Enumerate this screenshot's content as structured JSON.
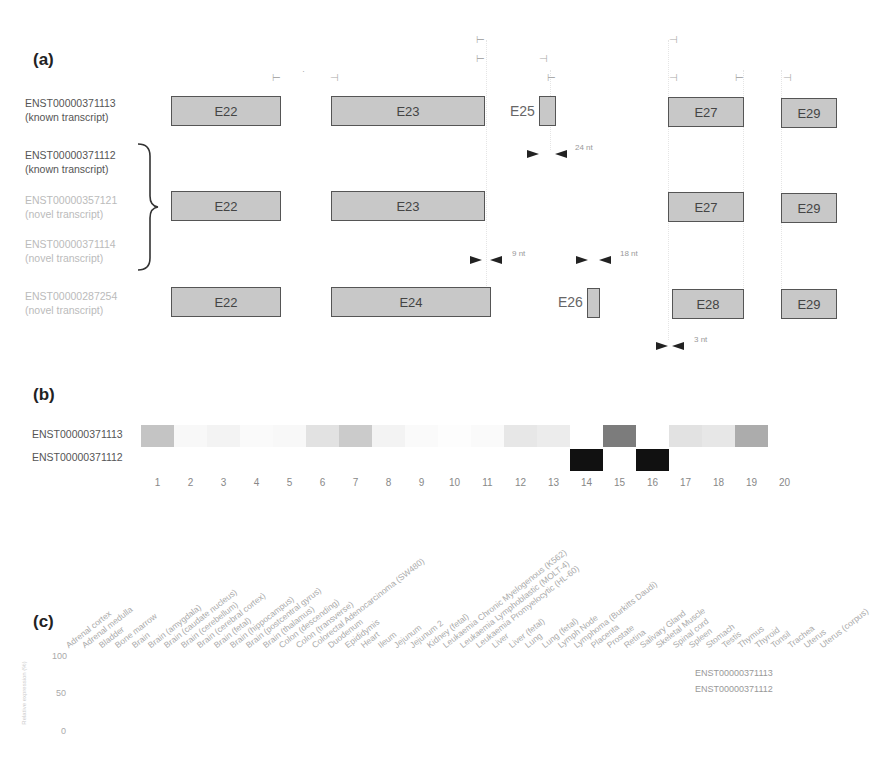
{
  "panel_a": {
    "label": "(a)",
    "transcripts": [
      {
        "id": "ENST00000371113",
        "note": "(known transcript)",
        "faint": false
      },
      {
        "id": "ENST00000371112",
        "note": "(known transcript)",
        "faint": false
      },
      {
        "id": "ENST00000357121",
        "note": "(novel transcript)",
        "faint": true
      },
      {
        "id": "ENST00000371114",
        "note": "(novel transcript)",
        "faint": true
      },
      {
        "id": "ENST00000287254",
        "note": "(novel transcript)",
        "faint": true
      }
    ],
    "row1_exons": [
      "E22",
      "E23",
      "E25",
      "E27",
      "E29"
    ],
    "row2_exons": [
      "E22",
      "E23",
      "E27",
      "E29"
    ],
    "row3_exons": [
      "E22",
      "E24",
      "E26",
      "E28",
      "E29"
    ],
    "arrow_labels": [
      "24 nt",
      "9 nt",
      "18 nt",
      "3 nt"
    ]
  },
  "panel_b": {
    "label": "(b)",
    "rows": [
      "ENST00000371113",
      "ENST00000371112"
    ],
    "columns": [
      "1",
      "2",
      "3",
      "4",
      "5",
      "6",
      "7",
      "8",
      "9",
      "10",
      "11",
      "12",
      "13",
      "14",
      "15",
      "16",
      "17",
      "18",
      "19",
      "20"
    ]
  },
  "panel_c": {
    "label": "(c)",
    "y_ticks": [
      "100",
      "50",
      "0"
    ],
    "y_axis_label": "Relative expression (%)",
    "tissues": [
      "Adrenal cortex",
      "Adrenal medulla",
      "Bladder",
      "Bone marrow",
      "Brain",
      "Brain (amygdala)",
      "Brain (caudate nucleus)",
      "Brain (cerebellum)",
      "Brain (cerebral cortex)",
      "Brain (fetal)",
      "Brain (hippocampus)",
      "Brain (postcentral gyrus)",
      "Brain (thalamus)",
      "Colon (descending)",
      "Colon (transverse)",
      "Colorectal Adenocarcinoma (SW480)",
      "Duodenum",
      "Epididymis",
      "Heart",
      "Ileum",
      "Jejunum",
      "Jejunum 2",
      "Kidney (fetal)",
      "Leukaemia Chronic Myelogenous (K562)",
      "Leukaemia Lymphoblastic (MOLT-4)",
      "Leukaemia Promyelocytic (HL-60)",
      "Liver",
      "Liver (fetal)",
      "Lung",
      "Lung (fetal)",
      "Lymph Node",
      "Lymphoma (Burkitts Daudi)",
      "Placenta",
      "Prostate",
      "Retina",
      "Salivary Gland",
      "Skeletal Muscle",
      "Spinal cord",
      "Spleen",
      "Stomach",
      "Testis",
      "Thymus",
      "Thyroid",
      "Tonsil",
      "Trachea",
      "Uterus",
      "Uterus (corpus)"
    ],
    "legend": [
      "ENST00000371113",
      "ENST00000371112"
    ]
  },
  "chart_data": {
    "type": "heatmap",
    "rows": [
      "ENST00000371113",
      "ENST00000371112"
    ],
    "columns": [
      1,
      2,
      3,
      4,
      5,
      6,
      7,
      8,
      9,
      10,
      11,
      12,
      13,
      14,
      15,
      16,
      17,
      18,
      19,
      20
    ],
    "values": [
      [
        0.25,
        0.03,
        0.05,
        0.02,
        0.03,
        0.12,
        0.22,
        0.05,
        0.02,
        0.01,
        0.02,
        0.1,
        0.08,
        0.0,
        0.55,
        0.0,
        0.12,
        0.1,
        0.35,
        0.0
      ],
      [
        0,
        0,
        0,
        0,
        0,
        0,
        0,
        0,
        0,
        0,
        0,
        0,
        0,
        1.0,
        0,
        1.0,
        0,
        0,
        0,
        0
      ]
    ],
    "colors": {
      "high": "#111111",
      "mid": "#999999",
      "low": "#e6e6e6"
    }
  }
}
